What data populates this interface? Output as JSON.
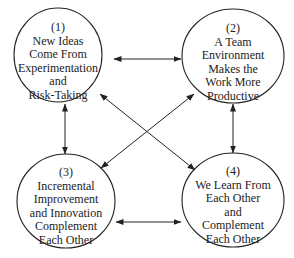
{
  "diagram": {
    "type": "relationship-cycle",
    "nodes": [
      {
        "id": "1",
        "number": "(1)",
        "lines": [
          "New Ideas",
          "Come From",
          "Experimentation",
          "and",
          "Risk-Taking"
        ]
      },
      {
        "id": "2",
        "number": "(2)",
        "lines": [
          "A Team",
          "Environment",
          "Makes the",
          "Work More",
          "Productive"
        ]
      },
      {
        "id": "3",
        "number": "(3)",
        "lines": [
          "Incremental",
          "Improvement",
          "and Innovation",
          "Complement",
          "Each Other"
        ]
      },
      {
        "id": "4",
        "number": "(4)",
        "lines": [
          "We Learn From",
          "Each Other",
          "and",
          "Complement",
          "Each Other"
        ]
      }
    ],
    "edges": [
      {
        "from": "1",
        "to": "2",
        "bidirectional": true
      },
      {
        "from": "1",
        "to": "3",
        "bidirectional": true
      },
      {
        "from": "2",
        "to": "4",
        "bidirectional": true
      },
      {
        "from": "3",
        "to": "4",
        "bidirectional": true
      },
      {
        "from": "1",
        "to": "4",
        "bidirectional": true
      },
      {
        "from": "2",
        "to": "3",
        "bidirectional": true
      }
    ],
    "colors": {
      "stroke": "#222222",
      "background": "#ffffff"
    }
  }
}
